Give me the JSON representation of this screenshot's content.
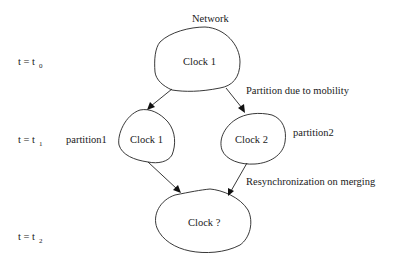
{
  "diagram": {
    "title": "Network",
    "time_labels": [
      {
        "base": "t = t",
        "sub": "0"
      },
      {
        "base": "t = t",
        "sub": "1"
      },
      {
        "base": "t = t",
        "sub": "2"
      }
    ],
    "nodes": {
      "top": {
        "label": "Clock 1"
      },
      "left": {
        "label": "Clock 1",
        "group": "partition1"
      },
      "right": {
        "label": "Clock 2",
        "group": "partition2"
      },
      "bottom": {
        "label": "Clock ?"
      }
    },
    "edge_labels": {
      "split": "Partition due to mobility",
      "merge": "Resynchronization on merging"
    },
    "edges": [
      {
        "from": "top",
        "to": "left"
      },
      {
        "from": "top",
        "to": "right"
      },
      {
        "from": "left",
        "to": "bottom"
      },
      {
        "from": "right",
        "to": "bottom"
      }
    ]
  }
}
